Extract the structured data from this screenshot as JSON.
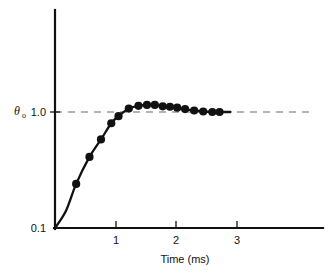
{
  "chart_data": {
    "type": "line",
    "title": "",
    "subtitle": "",
    "xlabel": "Time (ms)",
    "ylabel": "θ",
    "ylabel_subscript": "o",
    "ylabel_full": "θo",
    "yscale": "log",
    "xscale": "linear",
    "xlim": [
      0,
      4.43
    ],
    "ylim": [
      0.1,
      2.2
    ],
    "xticks": [
      1,
      2,
      3
    ],
    "xticklabels": [
      "1",
      "2",
      "3"
    ],
    "yticks": [
      0.1,
      1.0
    ],
    "yticklabels": [
      "0.1",
      "1.0"
    ],
    "grid": false,
    "legend": null,
    "annotations": [
      {
        "name": "reference-line",
        "type": "hline",
        "y": 1.0,
        "style": "dashed",
        "color": "#9a9a9a",
        "x_start": 0.0,
        "x_end": 4.25
      }
    ],
    "series": [
      {
        "name": "step-response",
        "marker": "filled-circle",
        "line": "solid",
        "color": "#111111",
        "x": [
          0.0,
          0.18,
          0.35,
          0.57,
          0.76,
          0.93,
          1.05,
          1.22,
          1.38,
          1.52,
          1.65,
          1.78,
          1.9,
          2.02,
          2.15,
          2.3,
          2.45,
          2.6,
          2.72,
          2.9
        ],
        "y": [
          0.1,
          0.14,
          0.24,
          0.41,
          0.58,
          0.8,
          0.92,
          1.07,
          1.13,
          1.15,
          1.15,
          1.12,
          1.11,
          1.09,
          1.06,
          1.03,
          1.01,
          1.0,
          1.0,
          1.0
        ],
        "marker_x": [
          0.35,
          0.57,
          0.76,
          0.93,
          1.05,
          1.22,
          1.38,
          1.52,
          1.65,
          1.78,
          1.9,
          2.02,
          2.15,
          2.3,
          2.45,
          2.6,
          2.72
        ],
        "marker_y": [
          0.24,
          0.41,
          0.58,
          0.8,
          0.92,
          1.07,
          1.13,
          1.15,
          1.15,
          1.12,
          1.11,
          1.09,
          1.06,
          1.03,
          1.01,
          1.0,
          1.0
        ]
      }
    ]
  },
  "axes": {
    "x_axis_name": "x-axis",
    "y_axis_name": "y-axis",
    "x_title": "Time (ms)",
    "y_symbol": "θ",
    "y_subscript": "o",
    "y_tick_top": "1.0",
    "y_tick_bottom": "0.1",
    "x_tick_1": "1",
    "x_tick_2": "2",
    "x_tick_3": "3"
  },
  "colors": {
    "curve": "#111111",
    "axis": "#111111",
    "reference": "#9a9a9a",
    "background": "#ffffff"
  }
}
